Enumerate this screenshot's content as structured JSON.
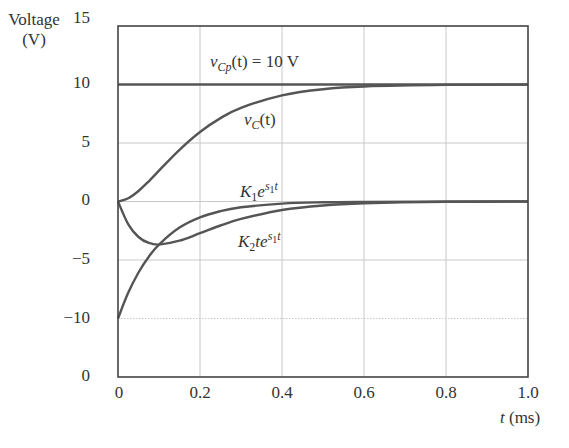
{
  "chart_data": {
    "type": "line",
    "title": "",
    "xlabel": "t (ms)",
    "ylabel": "Voltage (V)",
    "xlim": [
      0,
      1.0
    ],
    "ylim": [
      -15,
      15
    ],
    "grid": true,
    "legend": "none (inline annotations)",
    "x_ticks": [
      "0",
      "0.2",
      "0.4",
      "0.6",
      "0.8",
      "1.0"
    ],
    "y_ticks": [
      "15",
      "10",
      "5",
      "0",
      "−5",
      "−10",
      "0"
    ],
    "x": [
      0,
      0.025,
      0.05,
      0.075,
      0.1,
      0.15,
      0.2,
      0.25,
      0.3,
      0.4,
      0.5,
      0.6,
      0.8,
      1.0
    ],
    "series": [
      {
        "name": "v_Cp(t) = 10 V",
        "values": [
          10,
          10,
          10,
          10,
          10,
          10,
          10,
          10,
          10,
          10,
          10,
          10,
          10,
          10
        ]
      },
      {
        "name": "v_C(t)",
        "values": [
          0,
          0.27,
          0.9,
          1.73,
          2.64,
          4.42,
          5.94,
          7.13,
          8.01,
          9.08,
          9.6,
          9.83,
          9.97,
          9.99
        ]
      },
      {
        "name": "K1 e^(s1 t)",
        "values": [
          -10,
          -7.79,
          -6.07,
          -4.72,
          -3.68,
          -2.23,
          -1.35,
          -0.82,
          -0.5,
          -0.18,
          -0.07,
          -0.03,
          0,
          0
        ]
      },
      {
        "name": "K2 t e^(s1 t)",
        "values": [
          0,
          -1.95,
          -3.03,
          -3.54,
          -3.68,
          -3.35,
          -2.71,
          -2.05,
          -1.49,
          -0.73,
          -0.34,
          -0.15,
          -0.03,
          0
        ]
      }
    ]
  },
  "labels": {
    "ylabel_line1": "Voltage",
    "ylabel_line2": "(V)",
    "xlabel_var": "t",
    "xlabel_unit": " (ms)",
    "vcp": {
      "v": "v",
      "sub": "Cp",
      "rest": "(t) = 10 V"
    },
    "vc": {
      "v": "v",
      "sub": "C",
      "rest": "(t)"
    },
    "k1": {
      "K": "K",
      "sub": "1",
      "e": "e",
      "sup_s": "s",
      "sup_sub": "1",
      "sup_t": "t"
    },
    "k2": {
      "K": "K",
      "sub": "2",
      "te": "te",
      "sup_s": "s",
      "sup_sub": "1",
      "sup_t": "t"
    }
  },
  "style": {
    "curve_color": "#555555",
    "grid_color": "#c8c8c8",
    "axis_color": "#444444"
  }
}
